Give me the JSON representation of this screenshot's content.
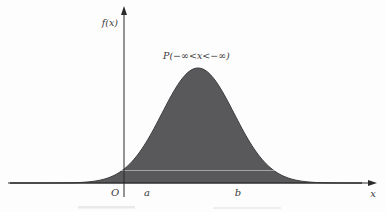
{
  "figure": {
    "y_axis_label": "f(x)",
    "x_axis_label": "x",
    "origin_label": "O",
    "a_label": "a",
    "b_label": "b",
    "probability_label": "P(−∞<x<−∞)"
  },
  "colors": {
    "background": "#fdfdfd",
    "curve_fill": "#59595b",
    "curve_stroke": "#3e3e40",
    "axis": "#2b2b2b",
    "label": "#3a3a3a",
    "scan_line": "rgba(255,255,255,0.45)",
    "caption_remnant": "#e9e9e9"
  },
  "chart_data": {
    "type": "area",
    "title": "",
    "xlabel": "x",
    "ylabel": "f(x)",
    "annotation": "P(−∞<x<−∞)",
    "x_tick_labels": [
      "O",
      "a",
      "b"
    ],
    "legend": "none",
    "grid": false,
    "curve": {
      "shape": "gaussian",
      "mu_px": 198,
      "sigma_px": 36,
      "peak_y_px": 68,
      "base_y_px": 183,
      "x_start_px": 10,
      "x_end_px": 362
    },
    "axes_px": {
      "y_axis_x": 124,
      "y_axis_top": 10,
      "y_axis_bottom": 197,
      "x_axis_y": 183,
      "x_axis_left": 8,
      "x_axis_right": 369
    }
  }
}
